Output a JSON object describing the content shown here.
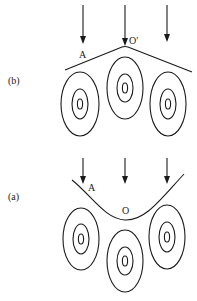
{
  "panels": {
    "b": {
      "label": "(b)",
      "point_a": "A",
      "point_o": "O′",
      "surface_shape": "convex-peak"
    },
    "a": {
      "label": "(a)",
      "point_a": "A",
      "point_o": "O",
      "surface_shape": "concave-valley"
    }
  },
  "colors": {
    "ink": "#1a1a1a",
    "background": "#ffffff"
  }
}
